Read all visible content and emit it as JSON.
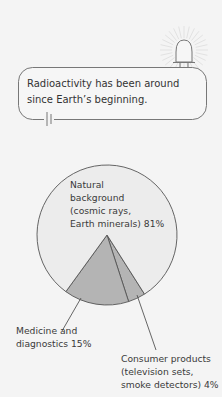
{
  "callout": {
    "text_lines": [
      "Radioactivity has been around",
      "since Earth’s beginning."
    ],
    "icon": "alarm-bell-icon",
    "decoration": "battery-symbol-icon"
  },
  "colors": {
    "background": "#f4f4f4",
    "natural_slice": "#ececec",
    "minor_slices": "#b4b4b4",
    "stroke": "#555555"
  },
  "chart_data": {
    "type": "pie",
    "title": "",
    "slices": [
      {
        "name": "natural",
        "label_lines": [
          "Natural",
          "background",
          "(cosmic rays,",
          "Earth minerals) 81%"
        ],
        "value": 81
      },
      {
        "name": "medicine",
        "label_lines": [
          "Medicine and",
          "diagnostics 15%"
        ],
        "value": 15
      },
      {
        "name": "consumer",
        "label_lines": [
          "Consumer products",
          "(television sets,",
          "smoke detectors) 4%"
        ],
        "value": 4
      }
    ],
    "unit": "%",
    "legend": "none"
  }
}
